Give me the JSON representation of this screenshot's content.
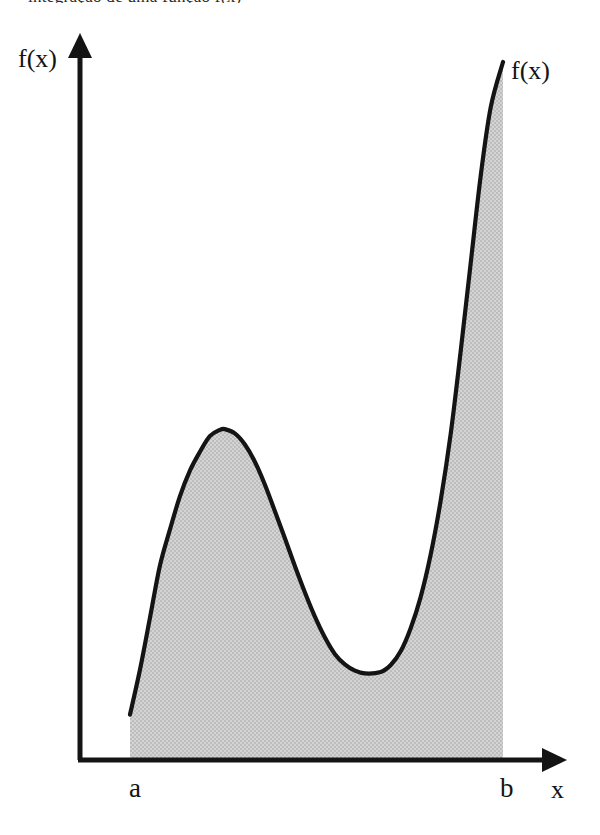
{
  "figure": {
    "caption_clipped": "integração de uma função f(x)",
    "y_axis_label": "f(x)",
    "curve_label": "f(x)",
    "x_axis_label": "x",
    "lower_limit_label": "a",
    "upper_limit_label": "b",
    "colors": {
      "stroke": "#141414",
      "fill": "#c9c9c9",
      "background": "#ffffff"
    }
  },
  "chart_data": {
    "type": "area",
    "title": "",
    "subtitle": "",
    "xlabel": "x",
    "ylabel": "f(x)",
    "legend": [],
    "legend_position": "none",
    "grid": false,
    "annotations": [
      {
        "text": "f(x)",
        "role": "y-axis-label",
        "x": 0,
        "y": 1.0
      },
      {
        "text": "f(x)",
        "role": "curve-label",
        "x": 1.0,
        "y": 0.98
      },
      {
        "text": "a",
        "role": "lower-limit-tick",
        "x": 0.0,
        "y": 0.0
      },
      {
        "text": "b",
        "role": "upper-limit-tick",
        "x": 1.0,
        "y": 0.0
      }
    ],
    "axis_ranges": {
      "xlim": [
        0,
        1
      ],
      "ylim": [
        0,
        1
      ]
    },
    "shaded_region": {
      "label": "definite integral area between a and b",
      "from": "a",
      "to": "b",
      "fill": "#c9c9c9"
    },
    "features": [
      {
        "name": "left-endpoint",
        "x": 0.0,
        "y": 0.065
      },
      {
        "name": "local-maximum",
        "x": 0.254,
        "y": 0.474
      },
      {
        "name": "local-minimum",
        "x": 0.672,
        "y": 0.126
      },
      {
        "name": "right-endpoint",
        "x": 1.0,
        "y": 1.0
      }
    ],
    "curve_points": [
      {
        "x": 0.0,
        "y": 0.065
      },
      {
        "x": 0.027,
        "y": 0.13
      },
      {
        "x": 0.054,
        "y": 0.205
      },
      {
        "x": 0.08,
        "y": 0.278
      },
      {
        "x": 0.107,
        "y": 0.33
      },
      {
        "x": 0.134,
        "y": 0.378
      },
      {
        "x": 0.161,
        "y": 0.415
      },
      {
        "x": 0.188,
        "y": 0.442
      },
      {
        "x": 0.214,
        "y": 0.464
      },
      {
        "x": 0.241,
        "y": 0.473
      },
      {
        "x": 0.254,
        "y": 0.474
      },
      {
        "x": 0.281,
        "y": 0.468
      },
      {
        "x": 0.308,
        "y": 0.452
      },
      {
        "x": 0.335,
        "y": 0.427
      },
      {
        "x": 0.362,
        "y": 0.394
      },
      {
        "x": 0.388,
        "y": 0.357
      },
      {
        "x": 0.415,
        "y": 0.318
      },
      {
        "x": 0.442,
        "y": 0.278
      },
      {
        "x": 0.469,
        "y": 0.24
      },
      {
        "x": 0.496,
        "y": 0.205
      },
      {
        "x": 0.523,
        "y": 0.175
      },
      {
        "x": 0.549,
        "y": 0.152
      },
      {
        "x": 0.576,
        "y": 0.137
      },
      {
        "x": 0.603,
        "y": 0.128
      },
      {
        "x": 0.63,
        "y": 0.124
      },
      {
        "x": 0.672,
        "y": 0.126
      },
      {
        "x": 0.699,
        "y": 0.136
      },
      {
        "x": 0.726,
        "y": 0.156
      },
      {
        "x": 0.752,
        "y": 0.188
      },
      {
        "x": 0.779,
        "y": 0.233
      },
      {
        "x": 0.806,
        "y": 0.294
      },
      {
        "x": 0.833,
        "y": 0.372
      },
      {
        "x": 0.86,
        "y": 0.468
      },
      {
        "x": 0.886,
        "y": 0.583
      },
      {
        "x": 0.913,
        "y": 0.71
      },
      {
        "x": 0.94,
        "y": 0.836
      },
      {
        "x": 0.967,
        "y": 0.935
      },
      {
        "x": 1.0,
        "y": 1.0
      }
    ]
  }
}
